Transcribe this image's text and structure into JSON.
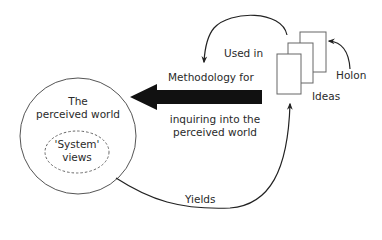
{
  "diagram": {
    "type": "conceptual-diagram",
    "nodes": {
      "perceived_world": {
        "line1": "The",
        "line2": "perceived world"
      },
      "system_views": {
        "line1": "'System'",
        "line2": "views"
      },
      "ideas": {
        "label": "Ideas"
      },
      "holon": {
        "label": "Holon"
      }
    },
    "edges": {
      "methodology": {
        "line1": "Methodology for",
        "line2": "inquiring into the",
        "line3": "perceived world"
      },
      "used_in": {
        "label": "Used in"
      },
      "yields": {
        "label": "Yields"
      }
    },
    "colors": {
      "stroke": "#555555",
      "arrow_fill": "#111111",
      "text": "#2a2a2a"
    }
  }
}
